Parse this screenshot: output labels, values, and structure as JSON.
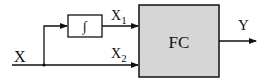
{
  "diagram": {
    "input_label": "X",
    "integrator_symbol": "∫",
    "branch1_label": "X",
    "branch1_subscript": "1",
    "branch2_label": "X",
    "branch2_subscript": "2",
    "block_label": "FC",
    "output_label": "Y"
  },
  "colors": {
    "line": "#111111",
    "block_fill": "#d6d6d6",
    "background": "#ffffff"
  }
}
